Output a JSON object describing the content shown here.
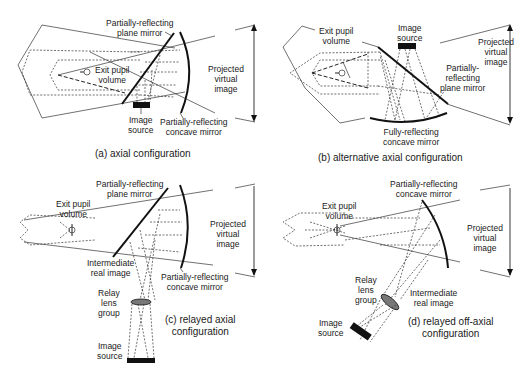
{
  "panels": [
    {
      "id": "a",
      "caption": "(a) axial configuration",
      "labels": {
        "plane_mirror": [
          "Partially-reflecting",
          "plane mirror"
        ],
        "exit_pupil": [
          "Exit pupil",
          "volume"
        ],
        "virtual_image": [
          "Projected",
          "virtual",
          "image"
        ],
        "image_source": [
          "Image",
          "source"
        ],
        "concave_mirror": [
          "Partially-reflecting",
          "concave mirror"
        ]
      }
    },
    {
      "id": "b",
      "caption": "(b) alternative axial configuration",
      "labels": {
        "exit_pupil": [
          "Exit pupil",
          "volume"
        ],
        "image_source": [
          "Image",
          "source"
        ],
        "virtual_image": [
          "Projected",
          "virtual",
          "image"
        ],
        "plane_mirror": [
          "Partially-",
          "reflecting",
          "plane mirror"
        ],
        "concave_mirror": [
          "Fully-reflecting",
          "concave mirror"
        ]
      }
    },
    {
      "id": "c",
      "caption": [
        "(c) relayed axial",
        "configuration"
      ],
      "labels": {
        "plane_mirror": [
          "Partially-reflecting",
          "plane mirror"
        ],
        "exit_pupil": [
          "Exit pupil",
          "volume"
        ],
        "virtual_image": [
          "Projected",
          "virtual",
          "image"
        ],
        "intermediate": [
          "Intermediate",
          "real image"
        ],
        "concave_mirror": [
          "Partially-reflecting",
          "concave mirror"
        ],
        "relay": [
          "Relay",
          "lens",
          "group"
        ],
        "image_source": [
          "Image",
          "source"
        ]
      }
    },
    {
      "id": "d",
      "caption": [
        "(d) relayed off-axial",
        "configuration"
      ],
      "labels": {
        "concave_mirror": [
          "Partially-reflecting",
          "concave mirror"
        ],
        "exit_pupil": [
          "Exit pupil",
          "volume"
        ],
        "virtual_image": [
          "Projected",
          "virtual",
          "image"
        ],
        "relay": [
          "Relay",
          "lens",
          "group"
        ],
        "intermediate": [
          "Intermediate",
          "real image"
        ],
        "image_source": [
          "Image",
          "source"
        ]
      }
    }
  ]
}
